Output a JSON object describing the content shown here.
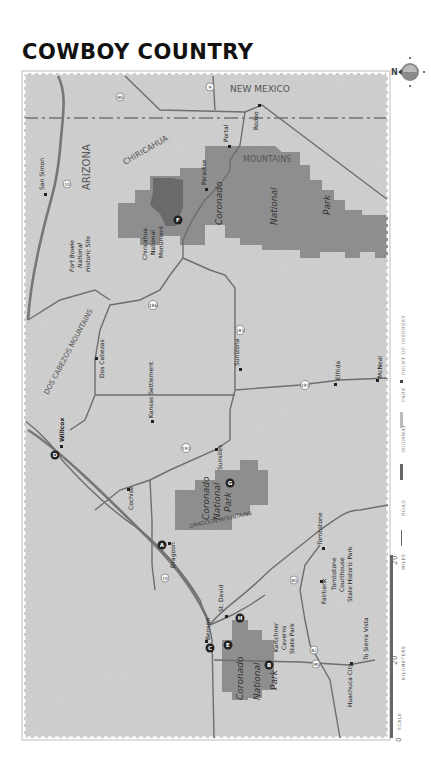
{
  "title": "COWBOY COUNTRY",
  "compass": {
    "label": "N"
  },
  "regions": {
    "state_nm": "NEW MEXICO",
    "state_az": "ARIZONA",
    "mountains_chiricahua_1": "CHIRICAHUA",
    "mountains_chiricahua_2": "MOUNTAINS",
    "mountains_dos_cabezos": "DOS CABEZOS MOUNTAINS",
    "mountains_dragoon": "DRAGOON MOUNTAINS"
  },
  "parks": {
    "coronado_east": [
      "Coronado",
      "National",
      "Park"
    ],
    "coronado_dragoon": [
      "Coronado",
      "National",
      "Park"
    ],
    "coronado_south": [
      "Coronado",
      "National",
      "Park"
    ],
    "chiricahua_nm": [
      "Chiricahua",
      "National",
      "Monument"
    ],
    "fort_bowie": [
      "Fort Bowie",
      "National",
      "Historic Site"
    ],
    "kartchner": [
      "Kartchner",
      "Caverns",
      "State Park"
    ],
    "tombstone_courthouse": [
      "Tombstone",
      "Courthouse",
      "State Historic Park"
    ]
  },
  "towns": {
    "rodeo": "Rodeo",
    "portal": "Portal",
    "paradise": "Paradise",
    "san_simon": "San Simon",
    "dos_cabezas": "Dos Cabezas",
    "kansas_settlement": "Kansas Settlement",
    "sunizona": "Sunizona",
    "elfrida": "Elfrida",
    "mcneal": "McNeal",
    "willcox": "Willcox",
    "cochise": "Cochise",
    "sunsites": "Sunsites",
    "dragoon": "Dragoon",
    "tombstone": "Tombstone",
    "fairbank": "Fairbank",
    "benson": "Benson",
    "st_david": "St. David",
    "huachuca_city": "Huachuca City",
    "to_sierra_vista": "To Sierra Vista"
  },
  "shields": {
    "i10_a": "10",
    "i10_b": "10",
    "us191_a": "191",
    "us191_b": "191",
    "sr186": "186",
    "sr181": "181",
    "sr80_a": "80",
    "sr80_b": "80",
    "sr82": "82",
    "sr90": "90",
    "sr9": "9"
  },
  "markers": {
    "A": "A",
    "B": "B",
    "C": "C",
    "D": "D",
    "E": "E",
    "F": "F",
    "G": "G",
    "H": "H"
  },
  "legend": {
    "scale_label": "SCALE",
    "zero": "0",
    "km_value": "20",
    "km_label": "KILOMETERS",
    "mi_value": "20",
    "mi_label": "MILES",
    "road": "ROAD",
    "highway": "HIGHWAY",
    "park": "PARK",
    "poi": "POINT OF INTEREST"
  },
  "colors": {
    "land": "#cfcfcf",
    "park": "#8e8e8e",
    "park_dark": "#6a6a6a",
    "road": "#6e6e6e",
    "border": "#9a9a9a"
  }
}
